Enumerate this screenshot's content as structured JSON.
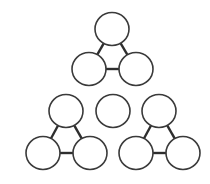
{
  "diagram": {
    "stroke_color": "#3a3a3a",
    "fill_color": "#ffffff",
    "radius": 17,
    "groups": [
      {
        "name": "top-triad",
        "nodes": [
          {
            "id": "t1",
            "cx": 112,
            "cy": 29
          },
          {
            "id": "t2",
            "cx": 89,
            "cy": 69
          },
          {
            "id": "t3",
            "cx": 136,
            "cy": 69
          }
        ],
        "edges": [
          [
            "t1",
            "t2"
          ],
          [
            "t1",
            "t3"
          ],
          [
            "t2",
            "t3"
          ]
        ]
      },
      {
        "name": "left-triad",
        "nodes": [
          {
            "id": "l1",
            "cx": 66,
            "cy": 111
          },
          {
            "id": "l2",
            "cx": 43,
            "cy": 153
          },
          {
            "id": "l3",
            "cx": 90,
            "cy": 153
          }
        ],
        "edges": [
          [
            "l1",
            "l2"
          ],
          [
            "l1",
            "l3"
          ],
          [
            "l2",
            "l3"
          ]
        ]
      },
      {
        "name": "middle-single",
        "nodes": [
          {
            "id": "m1",
            "cx": 113,
            "cy": 111
          }
        ],
        "edges": []
      },
      {
        "name": "right-triad",
        "nodes": [
          {
            "id": "r1",
            "cx": 159,
            "cy": 111
          },
          {
            "id": "r2",
            "cx": 136,
            "cy": 153
          },
          {
            "id": "r3",
            "cx": 183,
            "cy": 153
          }
        ],
        "edges": [
          [
            "r1",
            "r2"
          ],
          [
            "r1",
            "r3"
          ],
          [
            "r2",
            "r3"
          ]
        ]
      }
    ]
  }
}
